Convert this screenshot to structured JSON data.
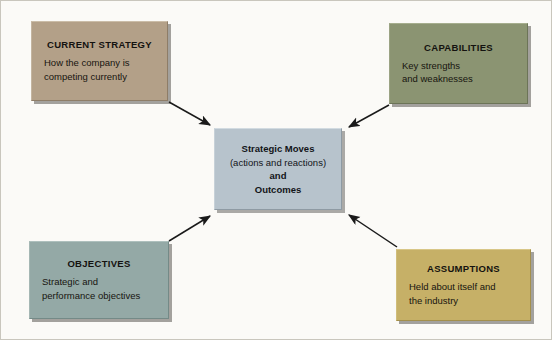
{
  "diagram": {
    "background_color": "#fbfaf7",
    "frame_color": "#c9c6bd",
    "arrow_color": "#1a1a1a",
    "center": {
      "name": "strategic-moves",
      "lines": [
        {
          "text": "Strategic Moves",
          "bold": true
        },
        {
          "text": "(actions and reactions)",
          "bold": false
        },
        {
          "text": "and",
          "bold": true
        },
        {
          "text": "Outcomes",
          "bold": true
        }
      ],
      "fill_color": "#b7c3cc",
      "border_color": "#8e9aa3"
    },
    "nodes": [
      {
        "id": "current-strategy",
        "title": "CURRENT STRATEGY",
        "body": "How the company is competing currently",
        "body_lines": [
          "How the company is",
          "competing currently"
        ],
        "fill_color": "#b3a088",
        "border_color": "#8e7d68",
        "position": "top-left"
      },
      {
        "id": "capabilities",
        "title": "CAPABILITIES",
        "body": "Key strengths and weaknesses",
        "body_lines": [
          "Key strengths",
          "and weaknesses"
        ],
        "fill_color": "#8b9472",
        "border_color": "#6c7458",
        "position": "top-right"
      },
      {
        "id": "objectives",
        "title": "OBJECTIVES",
        "body": "Strategic and performance objectives",
        "body_lines": [
          "Strategic and",
          "performance objectives"
        ],
        "fill_color": "#94a9a6",
        "border_color": "#748a87",
        "position": "bottom-left"
      },
      {
        "id": "assumptions",
        "title": "ASSUMPTIONS",
        "body": "Held about itself and the industry",
        "body_lines": [
          "Held about itself and",
          "the industry"
        ],
        "fill_color": "#c6b067",
        "border_color": "#a38f4c",
        "position": "bottom-right"
      }
    ],
    "arrows": [
      {
        "id": "arrow-current-strategy-to-center",
        "from": "current-strategy",
        "to": "strategic-moves"
      },
      {
        "id": "arrow-capabilities-to-center",
        "from": "capabilities",
        "to": "strategic-moves"
      },
      {
        "id": "arrow-objectives-to-center",
        "from": "objectives",
        "to": "strategic-moves"
      },
      {
        "id": "arrow-assumptions-to-center",
        "from": "assumptions",
        "to": "strategic-moves"
      }
    ]
  }
}
